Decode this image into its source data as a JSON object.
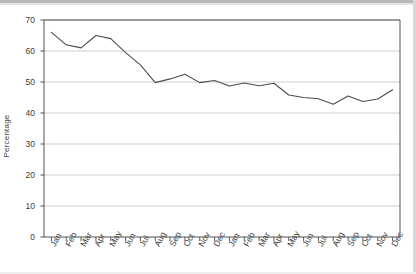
{
  "chart_data": {
    "type": "line",
    "title": "",
    "subtitle": "",
    "xlabel": "",
    "ylabel": "Percentage",
    "ylim": [
      0,
      70
    ],
    "yticks": [
      0,
      10,
      20,
      30,
      40,
      50,
      60,
      70
    ],
    "grid": true,
    "legend": "none",
    "categories": [
      "Jan",
      "Feb",
      "Mar",
      "Apr",
      "May",
      "Jun",
      "Jul",
      "Aug",
      "Sep",
      "Oct",
      "Nov",
      "Dec",
      "Jan",
      "Feb",
      "Mar",
      "Apr",
      "May",
      "Jun",
      "Jul",
      "Aug",
      "Sep",
      "Oct",
      "Nov",
      "Dec"
    ],
    "values": [
      66.0,
      62.0,
      61.0,
      65.0,
      64.0,
      59.5,
      55.5,
      49.8,
      51.0,
      52.5,
      49.8,
      50.5,
      48.7,
      49.7,
      48.8,
      49.6,
      45.8,
      45.0,
      44.6,
      42.8,
      45.5,
      43.7,
      44.5,
      47.5
    ],
    "series": [
      {
        "name": "Percentage",
        "color": "#4d4d4d",
        "values": [
          66.0,
          62.0,
          61.0,
          65.0,
          64.0,
          59.5,
          55.5,
          49.8,
          51.0,
          52.5,
          49.8,
          50.5,
          48.7,
          49.7,
          48.8,
          49.6,
          45.8,
          45.0,
          44.6,
          42.8,
          45.5,
          43.7,
          44.5,
          47.5
        ]
      }
    ],
    "colors": {
      "line": "#4d4d4d",
      "grid": "#c9c9c9",
      "axis": "#555555",
      "text": "#3b3b3b",
      "background": "#ffffff"
    }
  }
}
